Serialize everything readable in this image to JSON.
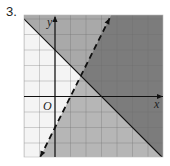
{
  "problem": {
    "number_label": "3."
  },
  "graph": {
    "x_axis_label": "x",
    "y_axis_label": "y",
    "origin_label": "O",
    "grid": {
      "x_min": -2,
      "x_max": 7,
      "y_min": -4,
      "y_max": 5.2,
      "step": 1
    },
    "colors": {
      "background": "#f4f4f4",
      "region_solid_only": "#a9a9a9",
      "region_dashed_only": "#b6b6b6",
      "region_overlap": "#7c7c7c",
      "grid_line": "#6a6a6a",
      "axis": "#111111",
      "boundary": "#111111"
    },
    "boundaries": [
      {
        "name": "solid-boundary",
        "equation": "y = -x + 3",
        "slope": -1,
        "intercept": 3,
        "style": "solid",
        "shaded_side": "above"
      },
      {
        "name": "dashed-boundary",
        "equation": "y = 2x - 2",
        "slope": 2,
        "intercept": -2,
        "style": "dashed",
        "shaded_side": "below"
      }
    ]
  }
}
